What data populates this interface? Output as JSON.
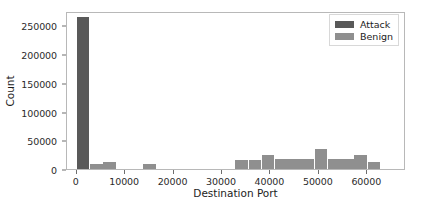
{
  "chart_data": {
    "type": "bar",
    "title": "",
    "xlabel": "Destination Port",
    "ylabel": "Count",
    "xlim": [
      -2000,
      68000
    ],
    "ylim": [
      0,
      275000
    ],
    "xticks": [
      0,
      10000,
      20000,
      30000,
      40000,
      50000,
      60000
    ],
    "xtick_labels": [
      "0",
      "10000",
      "20000",
      "30000",
      "40000",
      "50000",
      "60000"
    ],
    "yticks": [
      0,
      50000,
      100000,
      150000,
      200000,
      250000
    ],
    "ytick_labels": [
      "0",
      "50000",
      "100000",
      "150000",
      "200000",
      "250000"
    ],
    "grid": false,
    "legend_position": "upper right",
    "bin_width": 2730,
    "bin_starts": [
      0,
      2730,
      5460,
      8190,
      10920,
      13650,
      16380,
      19110,
      21840,
      24570,
      27300,
      30030,
      32760,
      35490,
      38220,
      40950,
      43680,
      46410,
      49140,
      51870,
      54600,
      57330,
      60060,
      62790
    ],
    "series": [
      {
        "name": "Attack",
        "color": "#595959",
        "values": [
          265000,
          0,
          0,
          0,
          0,
          0,
          0,
          0,
          0,
          0,
          0,
          0,
          0,
          0,
          0,
          0,
          0,
          0,
          0,
          0,
          0,
          0,
          0,
          0
        ]
      },
      {
        "name": "Benign",
        "color": "#8f8f8f",
        "values": [
          44000,
          9000,
          12000,
          0,
          0,
          8500,
          0,
          0,
          0,
          0,
          0,
          0,
          15000,
          16000,
          25000,
          17000,
          18000,
          18000,
          34000,
          18000,
          18000,
          25000,
          12000,
          0
        ]
      }
    ]
  },
  "legend": {
    "entries": [
      {
        "label": "Attack",
        "color": "#595959"
      },
      {
        "label": "Benign",
        "color": "#8f8f8f"
      }
    ]
  }
}
